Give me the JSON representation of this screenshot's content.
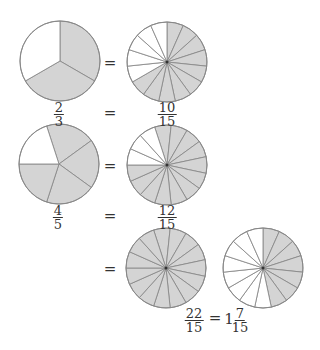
{
  "colors": {
    "fill": "#d4d4d4",
    "empty": "#ffffff",
    "stroke": "#8a8a8a",
    "outline": "#888888"
  },
  "circles": [
    {
      "id": "two-thirds",
      "cx": 60,
      "cy": 61,
      "r": 40,
      "slices": 3,
      "shaded": 2,
      "start_deg": 0,
      "shade_from_deg": 0
    },
    {
      "id": "ten-fifteenths",
      "cx": 167,
      "cy": 62,
      "r": 40,
      "slices": 15,
      "shaded": 10,
      "start_deg": 0,
      "shade_from_deg": 0
    },
    {
      "id": "four-fifths",
      "cx": 59,
      "cy": 164,
      "r": 40,
      "slices": 5,
      "shaded": 4,
      "start_deg": 342,
      "shade_from_deg": 342
    },
    {
      "id": "twelve-fifteenths",
      "cx": 167,
      "cy": 165,
      "r": 40,
      "slices": 15,
      "shaded": 12,
      "start_deg": 342,
      "shade_from_deg": 342
    },
    {
      "id": "fifteen-fifteenths",
      "cx": 166,
      "cy": 268,
      "r": 40,
      "slices": 15,
      "shaded": 15,
      "start_deg": 342,
      "shade_from_deg": 342
    },
    {
      "id": "seven-fifteenths",
      "cx": 263,
      "cy": 268,
      "r": 40,
      "slices": 15,
      "shaded": 7,
      "start_deg": 0,
      "shade_from_deg": 0
    }
  ],
  "equals": [
    {
      "x": 110,
      "y": 63,
      "text": "="
    },
    {
      "x": 110,
      "y": 113,
      "text": "="
    },
    {
      "x": 110,
      "y": 166,
      "text": "="
    },
    {
      "x": 110,
      "y": 216,
      "text": "="
    },
    {
      "x": 110,
      "y": 269,
      "text": "="
    },
    {
      "x": 215,
      "y": 318,
      "text": "="
    }
  ],
  "fractions": [
    {
      "x": 59,
      "y": 102,
      "num": "2",
      "den": "3"
    },
    {
      "x": 167,
      "y": 102,
      "num": "10",
      "den": "15"
    },
    {
      "x": 58,
      "y": 205,
      "num": "4",
      "den": "5"
    },
    {
      "x": 167,
      "y": 205,
      "num": "12",
      "den": "15"
    },
    {
      "x": 194,
      "y": 308,
      "num": "22",
      "den": "15"
    },
    {
      "x": 240,
      "y": 308,
      "num": "7",
      "den": "15"
    }
  ],
  "mixed_whole": {
    "x": 229,
    "y": 319,
    "text": "1"
  }
}
